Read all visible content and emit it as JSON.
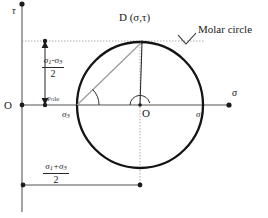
{
  "figure": {
    "axes": {
      "vertical_label": "τ",
      "horizontal_label": "σ",
      "origin_label": "O"
    },
    "circle": {
      "center_label": "O",
      "caption": "Molar circle",
      "left_intercept_label": "σ",
      "left_intercept_sub": "3",
      "right_intercept_label": "σ",
      "right_intercept_sub": "1",
      "pole_label": "Pole"
    },
    "point_d": {
      "label": "D (σ,τ)"
    },
    "dimensions": {
      "radius": {
        "numerator_a": "σ",
        "numerator_a_sub": "1",
        "numerator_op": "-",
        "numerator_b": "σ",
        "numerator_b_sub": "3",
        "denominator": "2"
      },
      "center_offset": {
        "numerator_a": "σ",
        "numerator_a_sub": "1",
        "numerator_op": "+",
        "numerator_b": "σ",
        "numerator_b_sub": "3",
        "denominator": "2"
      }
    },
    "colors": {
      "circle_stroke": "#141414",
      "axis_stroke": "#808080",
      "chord_stroke": "#8a8a8a",
      "radius_stroke": "#2e2e2e",
      "dotted_stroke": "#9a9a9a",
      "text": "#1a1a1a"
    },
    "geometry": {
      "circle_center_x": 140,
      "circle_center_y": 105,
      "circle_radius": 63,
      "tau_axis_x": 22,
      "sigma_axis_y": 105,
      "point_d_x": 142,
      "point_d_y": 42
    }
  }
}
